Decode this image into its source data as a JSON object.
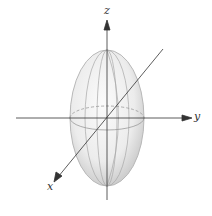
{
  "diagram": {
    "axes": {
      "x_label": "x",
      "y_label": "y",
      "z_label": "z"
    },
    "colors": {
      "axis": "#333333",
      "surface_light": "#f5f5f5",
      "surface_shade": "#c8c8c8",
      "grid_line": "#9a9a9a"
    }
  }
}
